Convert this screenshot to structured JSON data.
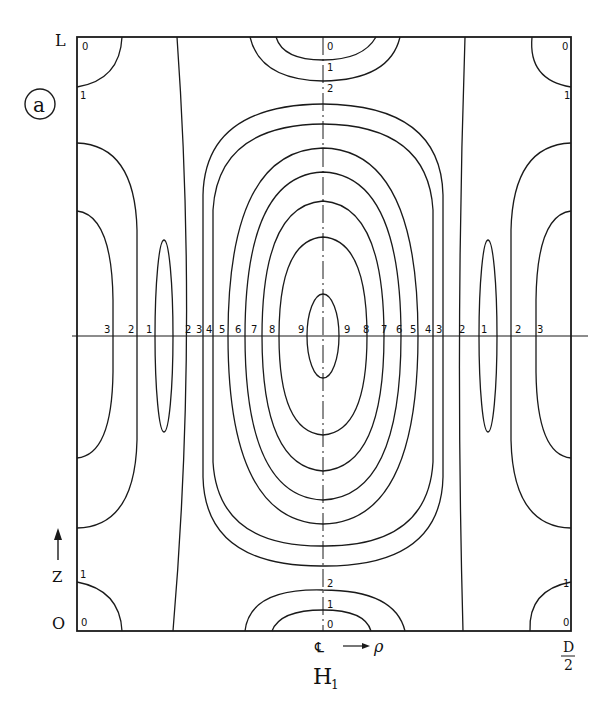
{
  "figure": {
    "panel_label": "a",
    "title": "H",
    "title_subscript": "1",
    "axes": {
      "top_left_label": "L",
      "bottom_left_label": "O",
      "z_axis_label": "Z",
      "centerline_symbol": "℄",
      "rho_label": "ρ",
      "right_label_numerator": "D",
      "right_label_denominator": "2"
    },
    "corner_labels": {
      "top_left_0": "0",
      "top_left_1": "1",
      "top_right_0": "0",
      "top_right_1": "1",
      "bottom_left_0": "0",
      "bottom_left_1": "1",
      "bottom_right_0": "0",
      "bottom_right_1": "1"
    },
    "center_axis_labels": {
      "top_0": "0",
      "top_1": "1",
      "top_2": "2",
      "bottom_2": "2",
      "bottom_1": "1",
      "bottom_0": "0"
    },
    "midline_labels": {
      "left": [
        "3",
        "2",
        "1",
        "2",
        "3",
        "4",
        "5",
        "6",
        "7",
        "8",
        "9"
      ],
      "right": [
        "9",
        "8",
        "7",
        "6",
        "5",
        "4",
        "3",
        "2",
        "1",
        "2",
        "3"
      ]
    },
    "colors": {
      "line": "#1a1a1a",
      "background": "#ffffff"
    }
  }
}
